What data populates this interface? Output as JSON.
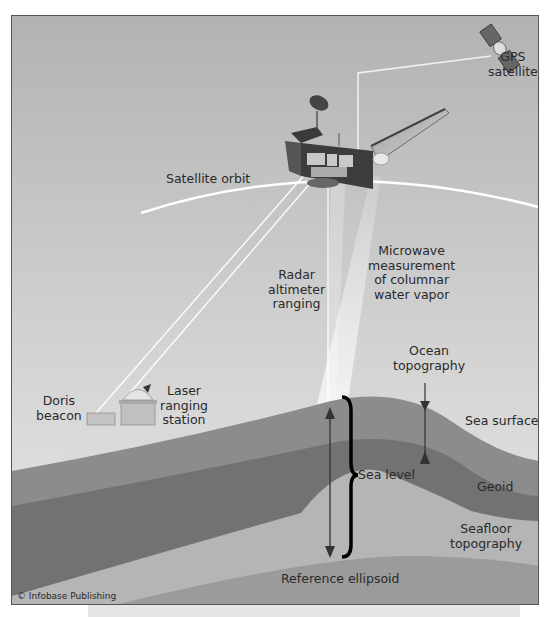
{
  "diagram": {
    "labels": {
      "gps_satellite": "GPS\nsatellite",
      "satellite_orbit": "Satellite orbit",
      "radar": "Radar\naltimeter\nranging",
      "microwave": "Microwave\nmeasurement\nof columnar\nwater vapor",
      "ocean_topography": "Ocean\ntopography",
      "doris": "Doris\nbeacon",
      "laser": "Laser\nranging\nstation",
      "sea_surface": "Sea surface",
      "sea_level": "Sea level",
      "geoid": "Geoid",
      "seafloor": "Seafloor\ntopography",
      "reference_ellipsoid": "Reference ellipsoid"
    },
    "credit": "© Infobase Publishing",
    "colors": {
      "sky_top": "#b4b4b4",
      "sky_bottom": "#e4e4e4",
      "orbit": "#ffffff",
      "sea_layer": "#8a8a8a",
      "geoid_layer": "#6f6f6f",
      "seafloor_layer": "#b3b3b3",
      "ellipsoid_layer": "#999999",
      "text": "#2a2a2a",
      "brace": "#000000"
    }
  }
}
